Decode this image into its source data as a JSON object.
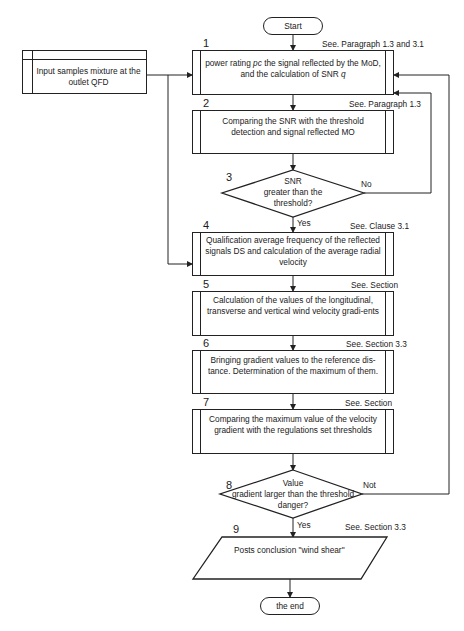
{
  "start": "Start",
  "end": "the end",
  "input": {
    "text": "Input samples mixture at the outlet QFD"
  },
  "steps": [
    {
      "num": "1",
      "ref": "See. Paragraph 1.3 and 3.1",
      "text_a": "power rating ",
      "text_em": "pc",
      "text_b": " the signal reflected by the MoD, and the calculation of SNR ",
      "text_em2": "q"
    },
    {
      "num": "2",
      "ref": "See. Paragraph 1.3",
      "text": "Comparing the SNR with the threshold detection and signal reflected MO"
    },
    {
      "num": "3",
      "ref": "",
      "text_lines": [
        "SNR",
        "greater than the",
        "threshold?"
      ],
      "yes": "Yes",
      "no": "No"
    },
    {
      "num": "4",
      "ref": "See. Clause 3.1",
      "text": "Qualification average frequency of the reflected signals DS and calculation of the average radial velocity"
    },
    {
      "num": "5",
      "ref": "See. Section",
      "text": "Calculation of the values of the longitudinal, transverse and vertical wind velocity gradi-ents"
    },
    {
      "num": "6",
      "ref": "See. Section 3.3",
      "text": "Bringing gradient values to the reference dis-tance. Determination of the maximum of them."
    },
    {
      "num": "7",
      "ref": "See. Section",
      "text": "Comparing the maximum value of the velocity gradient with the regulations set thresholds"
    },
    {
      "num": "8",
      "ref": "",
      "text_lines": [
        "Value",
        "gradient larger than the threshold",
        "danger?"
      ],
      "yes": "Yes",
      "no": "Not"
    },
    {
      "num": "9",
      "ref": "See. Section 3.3",
      "text": "Posts conclusion \"wind shear\""
    }
  ],
  "colors": {
    "line": "#222222",
    "background": "#ffffff",
    "text": "#1a1a1a"
  }
}
